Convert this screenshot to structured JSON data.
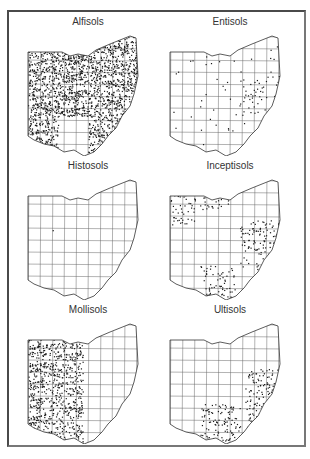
{
  "figure": {
    "panels": [
      {
        "id": "alfisols",
        "title": "Alfisols",
        "density": "very-high",
        "distribution": "statewide except southeast"
      },
      {
        "id": "entisols",
        "title": "Entisols",
        "density": "low",
        "distribution": "scattered, clusters in east and northwest"
      },
      {
        "id": "histosols",
        "title": "Histosols",
        "density": "very-low",
        "distribution": "sparse points"
      },
      {
        "id": "inceptisols",
        "title": "Inceptisols",
        "density": "medium",
        "distribution": "northwest, north shore, east and southeast"
      },
      {
        "id": "mollisols",
        "title": "Mollisols",
        "density": "high",
        "distribution": "western half"
      },
      {
        "id": "ultisols",
        "title": "Ultisols",
        "density": "medium",
        "distribution": "southeast and east"
      }
    ],
    "colors": {
      "outline": "#333333",
      "fill": "#1a1a1a",
      "frame": "#4a4a4a"
    }
  }
}
